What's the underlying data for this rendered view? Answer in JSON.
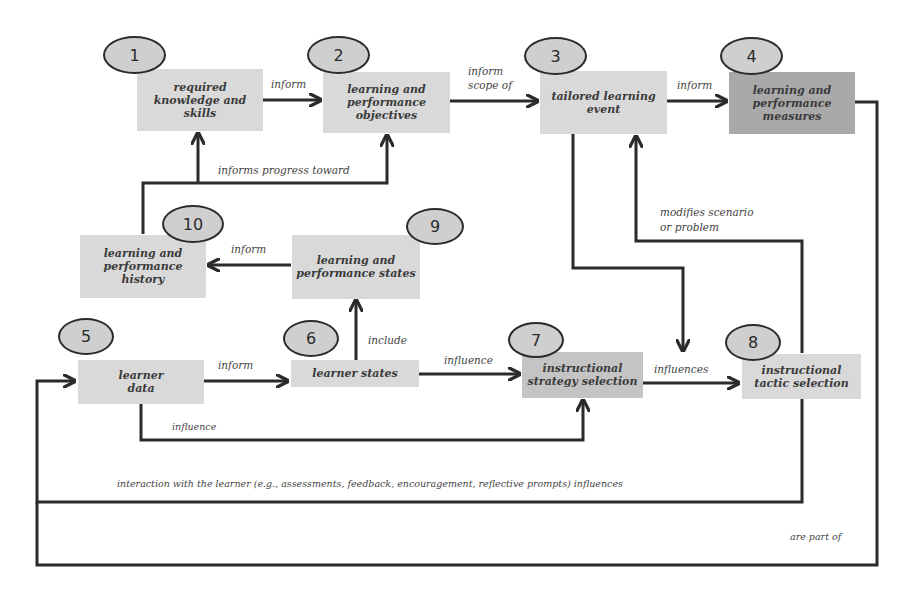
{
  "diagram": {
    "nodes": [
      {
        "id": 1,
        "number": "1",
        "label": "required knowledge and skills",
        "lines": [
          "required",
          "knowledge and",
          "skills"
        ]
      },
      {
        "id": 2,
        "number": "2",
        "label": "learning and performance objectives",
        "lines": [
          "learning and",
          "performance",
          "objectives"
        ]
      },
      {
        "id": 3,
        "number": "3",
        "label": "tailored learning event",
        "lines": [
          "tailored",
          "learning",
          "event"
        ]
      },
      {
        "id": 4,
        "number": "4",
        "label": "learning and performance measures",
        "lines": [
          "learning and",
          "performance",
          "measures"
        ]
      },
      {
        "id": 5,
        "number": "5",
        "label": "learner data",
        "lines": [
          "learner",
          "data"
        ]
      },
      {
        "id": 6,
        "number": "6",
        "label": "learner states",
        "lines": [
          "learner states"
        ]
      },
      {
        "id": 7,
        "number": "7",
        "label": "instructional strategy selection",
        "lines": [
          "instructional",
          "strategy selection"
        ]
      },
      {
        "id": 8,
        "number": "8",
        "label": "instructional tactic selection",
        "lines": [
          "instructional",
          "tactic selection"
        ]
      },
      {
        "id": 9,
        "number": "9",
        "label": "learning and performance states",
        "lines": [
          "learning and",
          "performance",
          "states"
        ]
      },
      {
        "id": 10,
        "number": "10",
        "label": "learning and performance history",
        "lines": [
          "learning and",
          "performance",
          "history"
        ]
      }
    ],
    "edges": [
      {
        "from": 1,
        "to": 2,
        "label": "inform"
      },
      {
        "from": 2,
        "to": 3,
        "label": "inform scope of",
        "lines": [
          "inform",
          "scope of"
        ]
      },
      {
        "from": 3,
        "to": 4,
        "label": "inform"
      },
      {
        "from": 10,
        "to": [
          1,
          2
        ],
        "label": "informs progress toward"
      },
      {
        "from": 9,
        "to": 10,
        "label": "inform"
      },
      {
        "from": 6,
        "to": 9,
        "label": "include"
      },
      {
        "from": 5,
        "to": 6,
        "label": "inform"
      },
      {
        "from": 6,
        "to": 7,
        "label": "influence"
      },
      {
        "from": 7,
        "to": 8,
        "label": "influences"
      },
      {
        "from": 3,
        "to": 8,
        "label": "influences"
      },
      {
        "from": 8,
        "to": 3,
        "label": "modifies scenario or problem",
        "lines": [
          "modifies scenario",
          "or problem"
        ]
      },
      {
        "from": 5,
        "to": 7,
        "label": "influence"
      },
      {
        "from": 8,
        "to": 5,
        "label": "interaction with the learner (e.g., assessments, feedback, encouragement, reflective prompts) influences"
      },
      {
        "from": 4,
        "to": 5,
        "label": "are part of"
      }
    ],
    "colors": {
      "box_light": "#d9d9d9",
      "box_mid": "#c4c4c4",
      "box_dark": "#a9a9a9",
      "ellipse_fill": "#cfcfcf",
      "line": "#2b2b2b"
    }
  }
}
